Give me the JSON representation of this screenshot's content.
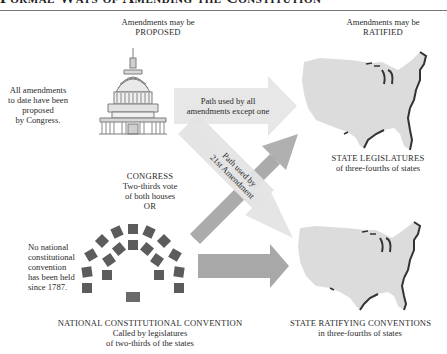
{
  "title": "Formal Ways of Amending the Constitution",
  "columns": {
    "proposed": {
      "line1": "Amendments may be",
      "line2": "PROPOSED"
    },
    "ratified": {
      "line1": "Amendments may be",
      "line2": "RATIFIED"
    }
  },
  "notes": {
    "congress_note": [
      "All amendments",
      "to date have been",
      "proposed",
      "by Congress."
    ],
    "convention_note": [
      "No national",
      "constitutional",
      "convention",
      "has been held",
      "since 1787."
    ]
  },
  "proposal_methods": {
    "congress": {
      "name": "CONGRESS",
      "detail1": "Two-thirds vote",
      "detail2": "of both houses",
      "connector": "OR",
      "icon": "capitol-building-icon"
    },
    "convention": {
      "name": "NATIONAL CONSTITUTIONAL CONVENTION",
      "detail1": "Called by legislatures",
      "detail2": "of two-thirds of the states",
      "icon": "convention-seating-icon"
    }
  },
  "ratification_methods": {
    "legislatures": {
      "name": "STATE LEGISLATURES",
      "detail": "of three-fourths of states",
      "icon": "us-map-icon"
    },
    "conventions": {
      "name": "STATE RATIFYING CONVENTIONS",
      "detail": "in three-fourths of states",
      "icon": "us-map-icon"
    }
  },
  "paths": {
    "main_path": {
      "line1": "Path used by all",
      "line2": "amendments except one"
    },
    "amendment21_path": {
      "line1": "Path used by",
      "line2": "21st Amendment"
    }
  },
  "colors": {
    "light_arrow": "#e6e6e6",
    "dark_arrow": "#a9a9a9",
    "map_fill": "#dcdcdc",
    "map_coast": "#3a3a3a",
    "seat": "#5a5a5a",
    "capitol": "#8a8a8a"
  }
}
